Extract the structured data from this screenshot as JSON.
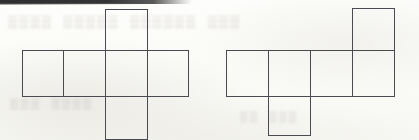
{
  "page": {
    "background_color": "#fcfcfa",
    "line_color": "#4a4a50",
    "width": 419,
    "height": 140
  },
  "artifacts": {
    "scan_band_top": "dark scanner edge band",
    "ghost_text_1": "photocopy bleed-through text",
    "ghost_text_2": "photocopy bleed-through text",
    "ghost_text_3": "photocopy bleed-through text"
  },
  "figures": [
    {
      "id": "left-net",
      "name": "cube-net-cross",
      "description": "Cross shaped cube net: row of four squares with one square above and one square below the third column",
      "cell_size": 42,
      "cells": [
        {
          "name": "row-col-1",
          "x": 22,
          "y": 50,
          "w": 42,
          "h": 47
        },
        {
          "name": "row-col-2",
          "x": 63,
          "y": 50,
          "w": 43,
          "h": 47
        },
        {
          "name": "row-col-3",
          "x": 105,
          "y": 50,
          "w": 43,
          "h": 47
        },
        {
          "name": "row-col-4",
          "x": 147,
          "y": 50,
          "w": 42,
          "h": 47
        },
        {
          "name": "top-flap",
          "x": 105,
          "y": 9,
          "w": 43,
          "h": 42
        },
        {
          "name": "bottom-flap",
          "x": 105,
          "y": 96,
          "w": 43,
          "h": 44
        }
      ]
    },
    {
      "id": "right-net",
      "name": "cube-net-zigzag",
      "description": "Z shaped cube net: row of four squares with one square above the fourth column and one square below the second column",
      "cell_size": 42,
      "cells": [
        {
          "name": "row-col-1",
          "x": 226,
          "y": 50,
          "w": 43,
          "h": 47
        },
        {
          "name": "row-col-2",
          "x": 268,
          "y": 50,
          "w": 43,
          "h": 47
        },
        {
          "name": "row-col-3",
          "x": 310,
          "y": 50,
          "w": 43,
          "h": 47
        },
        {
          "name": "row-col-4",
          "x": 352,
          "y": 50,
          "w": 43,
          "h": 47
        },
        {
          "name": "top-flap",
          "x": 352,
          "y": 8,
          "w": 43,
          "h": 43
        },
        {
          "name": "bottom-flap",
          "x": 268,
          "y": 96,
          "w": 43,
          "h": 40
        }
      ]
    }
  ]
}
